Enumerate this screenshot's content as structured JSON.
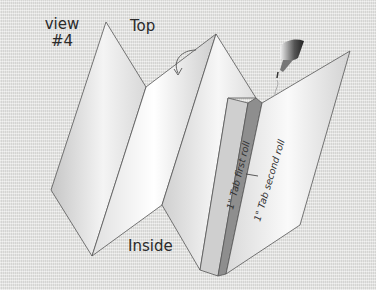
{
  "diagram": {
    "title_line1": "view",
    "title_line2": "#4",
    "top_label": "Top",
    "inside_label": "Inside",
    "tab_first_roll": "1\" Tab first roll",
    "tab_second_roll": "1\" Tab second roll",
    "icons": {
      "glue_bottle": "glue-bottle-icon",
      "fold_arrow": "curved-arrow-icon"
    },
    "colors": {
      "background": "#e4e4e2",
      "paper": "#f2f2f2",
      "paper_shade": "#c8c8c8",
      "tab_first": "#cfcfcf",
      "tab_second": "#8a8a8a",
      "outline": "#555555"
    }
  }
}
